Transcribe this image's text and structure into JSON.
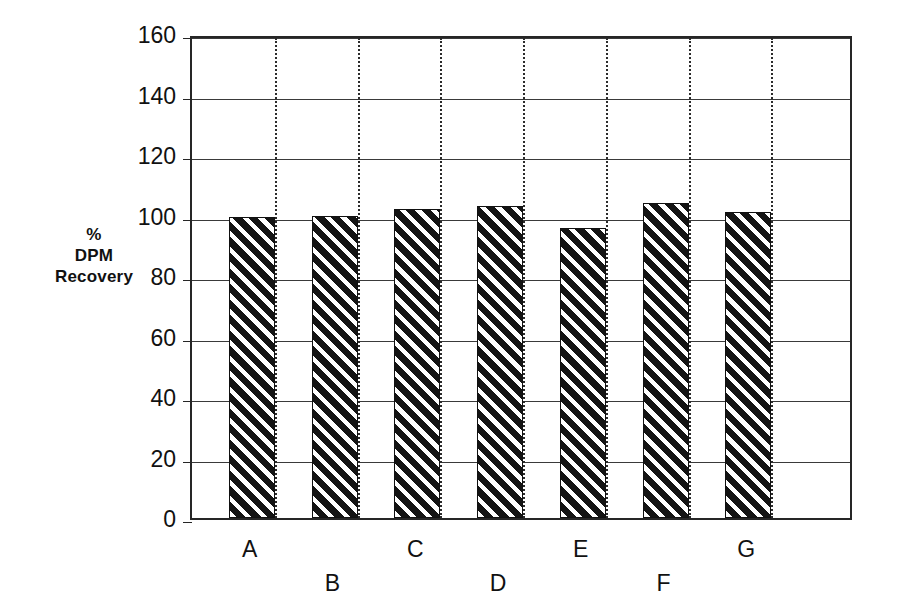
{
  "chart_data": {
    "type": "bar",
    "title": "",
    "xlabel": "",
    "ylabel": "% DPM Recovery",
    "ylabel_lines": [
      "%",
      "DPM",
      "Recovery"
    ],
    "categories": [
      "A",
      "B",
      "C",
      "D",
      "E",
      "F",
      "G"
    ],
    "values": [
      99.5,
      100,
      102,
      103,
      96,
      104,
      101
    ],
    "ylim": [
      0,
      160
    ],
    "ytick_labels": [
      "0",
      "20",
      "40",
      "60",
      "80",
      "100",
      "120",
      "140",
      "160"
    ],
    "ytick_values": [
      0,
      20,
      40,
      60,
      80,
      100,
      120,
      140,
      160
    ],
    "grid": {
      "horizontal": true,
      "vertical": true,
      "vertical_style": "dotted",
      "horizontal_style": "solid"
    },
    "legend": null,
    "bar_style": {
      "fill": "#141414",
      "hatch": "diagonal-stripes",
      "edge": "#111111"
    },
    "label_rows": [
      0,
      1,
      0,
      1,
      0,
      1,
      0
    ],
    "annotations": []
  },
  "figure": {
    "background": "#ffffff",
    "frame_color": "#262626"
  }
}
